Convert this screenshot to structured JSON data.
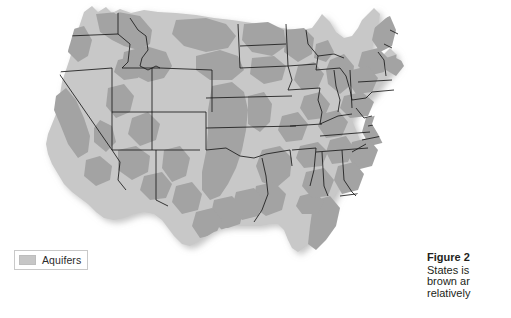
{
  "figure": {
    "kind": "thematic-map",
    "background_color": "#ffffff",
    "land_color": "#c8c8c8",
    "aquifer_color": "#a3a3a3",
    "border_color": "#1a1a1a",
    "shadow_color": "#e6e6e6"
  },
  "legend": {
    "swatch_name": "aquifer-swatch",
    "swatch_color": "#c6c6c6",
    "label": "Aquifers",
    "border_color": "#c9c9c9"
  },
  "caption": {
    "title": "Figure 2",
    "lines": [
      "States is",
      "brown ar",
      "relatively"
    ]
  },
  "map_regions": {
    "states": [
      "Washington",
      "Oregon",
      "California",
      "Nevada",
      "Idaho",
      "Montana",
      "Wyoming",
      "Utah",
      "Arizona",
      "Colorado",
      "New Mexico",
      "North Dakota",
      "South Dakota",
      "Nebraska",
      "Kansas",
      "Oklahoma",
      "Texas",
      "Minnesota",
      "Iowa",
      "Missouri",
      "Arkansas",
      "Louisiana",
      "Wisconsin",
      "Illinois",
      "Michigan",
      "Indiana",
      "Ohio",
      "Kentucky",
      "Tennessee",
      "Mississippi",
      "Alabama",
      "Georgia",
      "Florida",
      "South Carolina",
      "North Carolina",
      "Virginia",
      "West Virginia",
      "Pennsylvania",
      "New York",
      "Maine",
      "Vermont",
      "New Hampshire",
      "Massachusetts",
      "Rhode Island",
      "Connecticut",
      "New Jersey",
      "Delaware",
      "Maryland"
    ],
    "water_bodies": [
      "Lake Superior",
      "Lake Michigan",
      "Lake Huron",
      "Lake Erie",
      "Lake Ontario"
    ]
  }
}
